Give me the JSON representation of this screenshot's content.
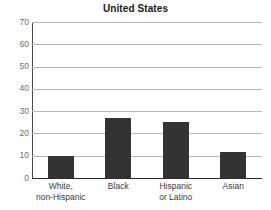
{
  "chart_data": {
    "type": "bar",
    "title": "United States",
    "xlabel": "",
    "ylabel": "",
    "categories": [
      "White, non-Hispanic",
      "Black",
      "Hispanic or Latino",
      "Asian"
    ],
    "category_lines": [
      [
        "White,",
        "non-Hispanic"
      ],
      [
        "Black",
        ""
      ],
      [
        "Hispanic",
        "or Latino"
      ],
      [
        "Asian",
        ""
      ]
    ],
    "values": [
      10,
      27,
      25,
      11.5
    ],
    "ylim": [
      0,
      70
    ],
    "ytick_values": [
      70,
      60,
      50,
      40,
      30,
      20,
      10,
      0
    ],
    "ytick_labels": [
      "70",
      "60",
      "50",
      "40",
      "30",
      "20",
      "10",
      "0"
    ],
    "grid": true,
    "grid_axis": "y",
    "legend": false,
    "legend_position": "none",
    "bar_color": "#333333",
    "gridline_color": "#b8b8b8",
    "axis_color": "#2b2b2b",
    "tick_label_color": "#6e6e6e",
    "background_color": "#ffffff"
  }
}
